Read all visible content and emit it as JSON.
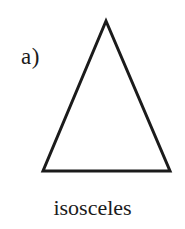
{
  "figure": {
    "part_label": "a)",
    "caption": "isosceles",
    "background_color": "#ffffff",
    "ink_color": "#1b1b1b",
    "shape": {
      "name": "isosceles-triangle",
      "stroke_color": "#1b1b1b",
      "stroke_width": 3,
      "fill": "none",
      "points": "106,21 170,171 43,171"
    }
  }
}
